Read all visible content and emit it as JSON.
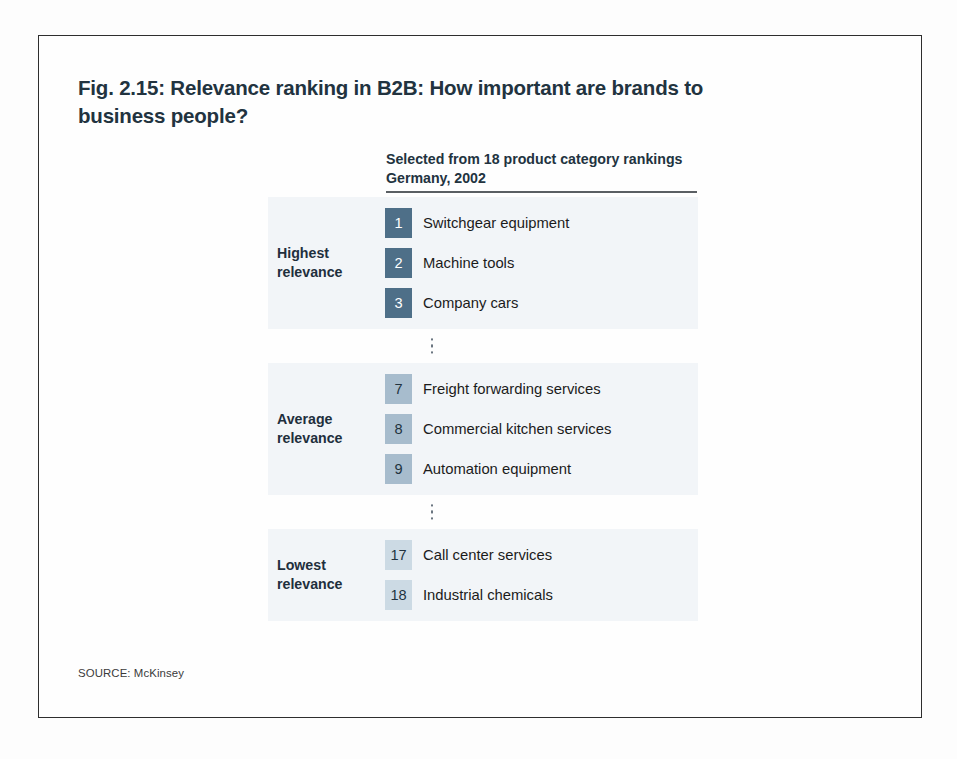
{
  "figure": {
    "title": "Fig. 2.15: Relevance ranking in B2B: How important are brands to business people?",
    "column_header": "Selected from 18 product category rankings Germany, 2002",
    "source": "SOURCE: McKinsey"
  },
  "colors": {
    "title_text": "#22333f",
    "band_background": "#f2f5f8",
    "tier_high_badge": "#4e6f88",
    "tier_average_badge": "#a7bccd",
    "tier_low_badge": "#ccdae4",
    "rule": "#5a5f63",
    "frame_border": "#2e2e2e"
  },
  "chart_data": {
    "type": "table",
    "title": "Fig. 2.15: Relevance ranking in B2B: How important are brands to business people?",
    "subtitle": "Selected from 18 product category rankings Germany, 2002",
    "columns": [
      "rank",
      "product category"
    ],
    "total_categories": 18,
    "country": "Germany",
    "year": 2002,
    "groups": [
      {
        "label": "Highest relevance",
        "label_line1": "Highest",
        "label_line2": "relevance",
        "tier": "high",
        "rows": [
          {
            "rank": "1",
            "label": "Switchgear equipment"
          },
          {
            "rank": "2",
            "label": "Machine tools"
          },
          {
            "rank": "3",
            "label": "Company cars"
          }
        ]
      },
      {
        "label": "Average relevance",
        "label_line1": "Average",
        "label_line2": "relevance",
        "tier": "average",
        "rows": [
          {
            "rank": "7",
            "label": "Freight forwarding services"
          },
          {
            "rank": "8",
            "label": "Commercial kitchen services"
          },
          {
            "rank": "9",
            "label": "Automation equipment"
          }
        ]
      },
      {
        "label": "Lowest relevance",
        "label_line1": "Lowest",
        "label_line2": "relevance",
        "tier": "low",
        "rows": [
          {
            "rank": "17",
            "label": "Call center services"
          },
          {
            "rank": "18",
            "label": "Industrial chemicals"
          }
        ]
      }
    ]
  }
}
